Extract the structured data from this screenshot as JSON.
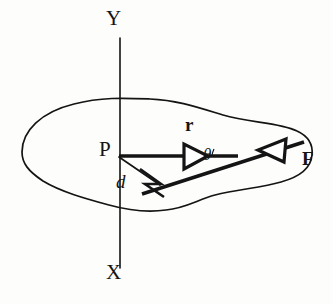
{
  "figure": {
    "kind": "torque-moment-diagram",
    "background_color": "#fdfdfc",
    "ink_color": "#141414",
    "width": 333,
    "height": 304
  },
  "axes": {
    "y_label": "Y",
    "x_label": "X",
    "y_label_pos": [
      112,
      18
    ],
    "x_label_pos": [
      112,
      271
    ],
    "axis_line": {
      "x": 120,
      "y_top": 38,
      "y_bottom": 268,
      "stroke_width": 1.6
    }
  },
  "body_outline": {
    "name": "rigid-body-blob",
    "stroke_width": 1.7,
    "fill": "none",
    "path": "M 22 152 C 22 132, 40 113, 74 105 C 104 98, 126 99, 150 99 C 176 99, 196 106, 222 114 C 248 122, 278 122, 296 130 C 310 136, 313 146, 312 155 C 311 167, 300 176, 282 181 C 262 187, 238 189, 215 194 C 196 198, 186 207, 166 210 C 146 213, 128 210, 110 205 C 88 199, 62 193, 44 182 C 28 172, 22 164, 22 152 Z"
  },
  "points": {
    "P": {
      "label": "P",
      "label_pos": [
        101,
        145
      ],
      "coord": [
        119,
        156
      ]
    },
    "F": {
      "label": "F",
      "label_pos": [
        289,
        148
      ],
      "coord": [
        300,
        143
      ]
    }
  },
  "vectors": [
    {
      "name": "r-vector",
      "label": "r",
      "label_pos": [
        185,
        125
      ],
      "from": [
        119,
        156
      ],
      "to": [
        232,
        156
      ],
      "stroke_width": 3.4,
      "arrowhead": {
        "style": "hollow-triangle",
        "at": [
          182,
          156
        ],
        "length": 26,
        "half_width": 12,
        "angle_deg": 0
      }
    },
    {
      "name": "F-vector",
      "label": "F",
      "label_pos": [
        289,
        148
      ],
      "from": [
        143,
        193
      ],
      "to": [
        303,
        142
      ],
      "stroke_width": 3.4,
      "arrowhead": {
        "style": "hollow-triangle",
        "at": [
          280,
          149
        ],
        "length": 27,
        "half_width": 12,
        "angle_deg": -17.7
      }
    }
  ],
  "moment_arm": {
    "name": "moment-arm-d",
    "label": "d",
    "label_pos": [
      118,
      179
    ],
    "from": [
      119,
      157
    ],
    "to": [
      159,
      184
    ],
    "stroke_width": 1.7,
    "right_angle_marker": {
      "name": "right-angle-marker",
      "points": "141 170 160 184 145 184 163 196"
    }
  },
  "angle": {
    "name": "angle-theta",
    "label": "θ",
    "label_pos": [
      203,
      153
    ],
    "vertex": [
      232,
      156
    ],
    "arc": {
      "radius": 13,
      "start_deg": 180,
      "end_deg": 198
    }
  }
}
